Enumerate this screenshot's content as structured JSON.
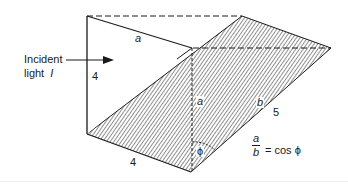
{
  "diagram": {
    "type": "geometry-prism-incident-light",
    "incident_label_line1": "Incident",
    "incident_label_line2": "light",
    "incident_symbol": "I",
    "front_face": {
      "side_label_left": "4",
      "hypotenuse_label": "a"
    },
    "bottom_label": "4",
    "vertical_label": "a",
    "slant_label_var": "b",
    "slant_label_num": "5",
    "angle_symbol": "ϕ",
    "equation": {
      "numerator": "a",
      "denominator": "b",
      "rhs": "= cos ϕ"
    },
    "colors": {
      "line": "#1a1a1a",
      "hatch": "#333333",
      "background": "#ffffff"
    }
  }
}
